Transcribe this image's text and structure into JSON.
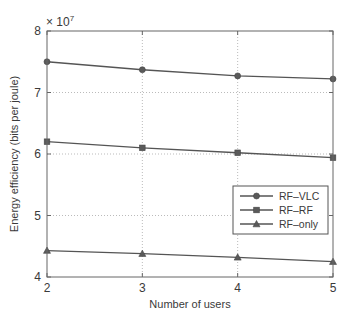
{
  "chart_data": {
    "type": "line",
    "title": "",
    "xlabel": "Number of users",
    "ylabel": "Energy efficiency (bits per joule)",
    "y_multiplier_label": "× 10",
    "y_multiplier_exponent": "7",
    "x": [
      2,
      3,
      4,
      5
    ],
    "xlim": [
      2,
      5
    ],
    "ylim": [
      4,
      8
    ],
    "x_ticks": [
      "2",
      "3",
      "4",
      "5"
    ],
    "y_ticks": [
      "4",
      "5",
      "6",
      "7",
      "8"
    ],
    "grid": true,
    "legend_position": "right-center (inside)",
    "series": [
      {
        "name": "RF–VLC",
        "marker": "circle",
        "values": [
          7.5,
          7.37,
          7.27,
          7.22
        ]
      },
      {
        "name": "RF–RF",
        "marker": "square",
        "values": [
          6.2,
          6.1,
          6.02,
          5.94
        ]
      },
      {
        "name": "RF–only",
        "marker": "triangle",
        "values": [
          4.43,
          4.38,
          4.32,
          4.25
        ]
      }
    ],
    "units_scale": 10000000
  },
  "colors": {
    "line": "#555555",
    "marker": "#5a5a5a",
    "grid": "#bbbbbb",
    "axis": "#666666"
  }
}
